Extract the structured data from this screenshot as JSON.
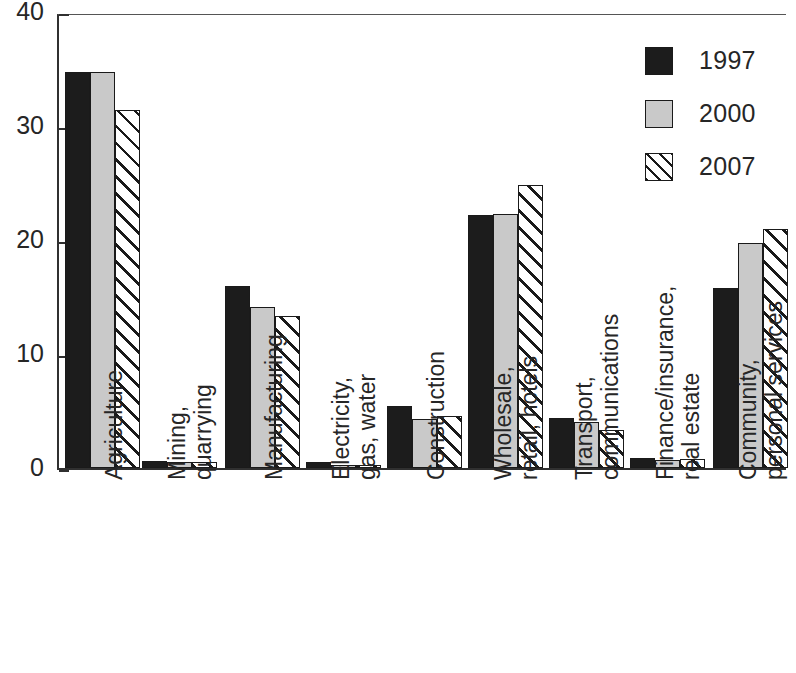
{
  "chart_data": {
    "type": "bar",
    "title": "",
    "subtitle": "",
    "xlabel": "",
    "ylabel": "",
    "ylim": [
      0,
      40
    ],
    "yticks": [
      "0",
      "10",
      "20",
      "30",
      "40"
    ],
    "ytick_values": [
      0,
      10,
      20,
      30,
      40
    ],
    "grid": false,
    "legend_position": "top-right",
    "categories": [
      "Agriculture",
      "Mining, quarrying",
      "Manufacturing",
      "Electricity, gas, water",
      "Construction",
      "Wholesale, retail, hotels",
      "Transport, communications",
      "Finance/insurance, real estate",
      "Community, personal services"
    ],
    "category_lines": [
      [
        "Agriculture"
      ],
      [
        "Mining,",
        "quarrying"
      ],
      [
        "Manufacturing"
      ],
      [
        "Electricity,",
        "gas, water"
      ],
      [
        "Construction"
      ],
      [
        "Wholesale,",
        "retail, hotels"
      ],
      [
        "Transport,",
        "communications"
      ],
      [
        "Finance/insurance,",
        "real estate"
      ],
      [
        "Community,",
        "personal services"
      ]
    ],
    "series": [
      {
        "name": "1997",
        "color": "#1c1c1c",
        "pattern": "solid-black",
        "values": [
          34.7,
          0.6,
          16.0,
          0.5,
          5.4,
          22.2,
          4.4,
          0.9,
          15.8
        ]
      },
      {
        "name": "2000",
        "color": "#c9c9c9",
        "pattern": "solid-grey",
        "values": [
          34.7,
          0.5,
          14.1,
          0.3,
          4.3,
          22.3,
          4.0,
          0.7,
          19.7
        ]
      },
      {
        "name": "2007",
        "color": "#ffffff",
        "pattern": "diagonal-hatch",
        "values": [
          31.4,
          0.5,
          13.3,
          0.3,
          4.6,
          24.8,
          3.3,
          0.8,
          21.0
        ]
      }
    ]
  },
  "legend": {
    "entries": [
      {
        "label": "1997"
      },
      {
        "label": "2000"
      },
      {
        "label": "2007"
      }
    ]
  }
}
